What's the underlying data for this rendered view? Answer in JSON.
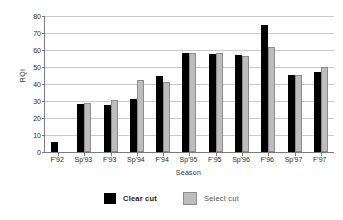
{
  "chart_data": {
    "type": "bar",
    "title": "",
    "xlabel": "Season",
    "ylabel": "RQI",
    "ylim": [
      0,
      80
    ],
    "yticks": [
      0,
      10,
      20,
      30,
      40,
      50,
      60,
      70,
      80
    ],
    "grid": true,
    "legend_position": "bottom",
    "categories": [
      "F'92",
      "Sp'93",
      "F'93",
      "Sp'94",
      "F'94",
      "Sp'95",
      "F'95",
      "Sp'96",
      "F'96",
      "Sp'97",
      "F'97"
    ],
    "series": [
      {
        "name": "Clear cut",
        "color": "#000000",
        "values": [
          6,
          28.5,
          27.5,
          31,
          44.5,
          58,
          57.5,
          57,
          75,
          45.5,
          47
        ]
      },
      {
        "name": "Select cut",
        "color": "#bdbdbd",
        "values": [
          0,
          29,
          30.5,
          42.5,
          41,
          58,
          58,
          56.5,
          62,
          45.5,
          50
        ]
      }
    ]
  },
  "axes": {
    "y_title": "RQI",
    "x_title": "Season",
    "y_tick_labels": [
      "0",
      "10",
      "20",
      "30",
      "40",
      "50",
      "60",
      "70",
      "80"
    ]
  },
  "legend": {
    "items": [
      {
        "label": "Clear cut",
        "swatch": "black-square-icon"
      },
      {
        "label": "Select cut",
        "swatch": "gray-square-icon"
      }
    ]
  }
}
